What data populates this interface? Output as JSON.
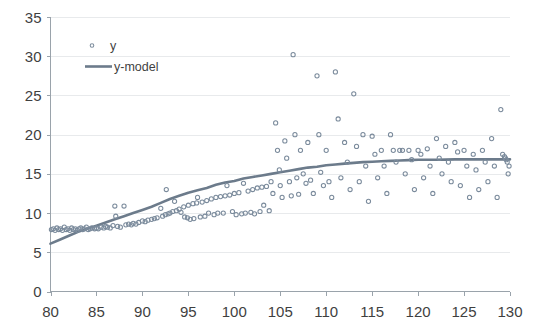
{
  "chart_data": {
    "type": "scatter",
    "title": "",
    "xlabel": "",
    "ylabel": "",
    "xlim": [
      80,
      130
    ],
    "ylim": [
      0,
      35
    ],
    "xticks": [
      80,
      85,
      90,
      95,
      100,
      105,
      110,
      115,
      120,
      125,
      130
    ],
    "yticks": [
      0,
      5,
      10,
      15,
      20,
      25,
      30,
      35
    ],
    "grid": true,
    "legend_position": "top-left",
    "colors": {
      "marker": "#7b8b9c",
      "line": "#6c7b8b",
      "gridline": "#e8eaec",
      "axis": "#9aa3ab",
      "text": "#3f3f3f",
      "background": "#ffffff"
    },
    "series": [
      {
        "name": "y",
        "type": "scatter",
        "marker": "open-circle",
        "points": [
          [
            80.1,
            7.9
          ],
          [
            80.3,
            8.0
          ],
          [
            80.5,
            7.8
          ],
          [
            80.7,
            8.1
          ],
          [
            80.9,
            7.9
          ],
          [
            81.1,
            8.0
          ],
          [
            81.3,
            7.8
          ],
          [
            81.5,
            8.2
          ],
          [
            81.7,
            7.9
          ],
          [
            81.9,
            8.0
          ],
          [
            82.1,
            7.8
          ],
          [
            82.3,
            8.1
          ],
          [
            82.5,
            7.9
          ],
          [
            82.7,
            8.0
          ],
          [
            82.9,
            7.8
          ],
          [
            83.1,
            8.0
          ],
          [
            83.3,
            8.1
          ],
          [
            83.5,
            7.9
          ],
          [
            83.7,
            8.0
          ],
          [
            83.9,
            8.2
          ],
          [
            84.1,
            7.9
          ],
          [
            84.3,
            8.0
          ],
          [
            84.5,
            8.1
          ],
          [
            84.8,
            8.0
          ],
          [
            85.0,
            8.1
          ],
          [
            85.2,
            8.0
          ],
          [
            85.5,
            8.2
          ],
          [
            85.8,
            8.1
          ],
          [
            86.0,
            8.3
          ],
          [
            86.2,
            8.2
          ],
          [
            86.5,
            8.1
          ],
          [
            86.8,
            8.4
          ],
          [
            87.0,
            10.9
          ],
          [
            87.1,
            9.6
          ],
          [
            87.3,
            8.3
          ],
          [
            87.6,
            8.2
          ],
          [
            88.0,
            10.9
          ],
          [
            88.2,
            8.5
          ],
          [
            88.5,
            8.6
          ],
          [
            88.8,
            8.5
          ],
          [
            89.0,
            8.7
          ],
          [
            89.3,
            8.6
          ],
          [
            89.6,
            8.8
          ],
          [
            90.0,
            9.0
          ],
          [
            90.3,
            8.9
          ],
          [
            90.6,
            9.1
          ],
          [
            91.0,
            9.2
          ],
          [
            91.3,
            9.3
          ],
          [
            91.6,
            9.4
          ],
          [
            92.0,
            10.6
          ],
          [
            92.2,
            9.6
          ],
          [
            92.5,
            9.8
          ],
          [
            92.6,
            13.0
          ],
          [
            92.8,
            9.9
          ],
          [
            93.0,
            10.0
          ],
          [
            93.3,
            10.2
          ],
          [
            93.5,
            11.5
          ],
          [
            93.7,
            10.3
          ],
          [
            94.0,
            10.5
          ],
          [
            94.2,
            10.1
          ],
          [
            94.5,
            10.8
          ],
          [
            94.6,
            9.5
          ],
          [
            94.9,
            9.4
          ],
          [
            95.0,
            11.0
          ],
          [
            95.2,
            9.2
          ],
          [
            95.5,
            11.2
          ],
          [
            95.6,
            9.3
          ],
          [
            95.9,
            11.3
          ],
          [
            96.0,
            12.0
          ],
          [
            96.3,
            9.5
          ],
          [
            96.5,
            11.4
          ],
          [
            96.8,
            9.6
          ],
          [
            97.0,
            11.6
          ],
          [
            97.2,
            10.0
          ],
          [
            97.5,
            11.8
          ],
          [
            97.8,
            9.8
          ],
          [
            98.0,
            12.0
          ],
          [
            98.2,
            10.0
          ],
          [
            98.5,
            12.1
          ],
          [
            98.8,
            10.0
          ],
          [
            99.0,
            12.2
          ],
          [
            99.2,
            13.5
          ],
          [
            99.5,
            12.3
          ],
          [
            99.8,
            10.2
          ],
          [
            100.0,
            12.5
          ],
          [
            100.2,
            9.8
          ],
          [
            100.5,
            12.6
          ],
          [
            100.8,
            9.9
          ],
          [
            101.0,
            13.8
          ],
          [
            101.2,
            10.0
          ],
          [
            101.5,
            12.8
          ],
          [
            101.8,
            10.1
          ],
          [
            102.0,
            13.0
          ],
          [
            102.2,
            9.9
          ],
          [
            102.5,
            13.2
          ],
          [
            102.8,
            10.2
          ],
          [
            103.0,
            13.3
          ],
          [
            103.2,
            11.0
          ],
          [
            103.5,
            13.4
          ],
          [
            103.8,
            10.3
          ],
          [
            104.0,
            14.0
          ],
          [
            104.2,
            12.5
          ],
          [
            104.5,
            21.5
          ],
          [
            104.7,
            18.0
          ],
          [
            104.9,
            15.5
          ],
          [
            105.0,
            13.5
          ],
          [
            105.2,
            12.0
          ],
          [
            105.5,
            19.2
          ],
          [
            105.7,
            17.0
          ],
          [
            106.0,
            14.0
          ],
          [
            106.2,
            12.2
          ],
          [
            106.4,
            30.2
          ],
          [
            106.6,
            20.0
          ],
          [
            106.8,
            14.5
          ],
          [
            107.0,
            12.4
          ],
          [
            107.2,
            18.0
          ],
          [
            107.5,
            15.0
          ],
          [
            107.8,
            13.8
          ],
          [
            108.0,
            19.0
          ],
          [
            108.3,
            14.2
          ],
          [
            108.6,
            12.5
          ],
          [
            109.0,
            27.5
          ],
          [
            109.2,
            20.0
          ],
          [
            109.4,
            15.2
          ],
          [
            109.7,
            13.5
          ],
          [
            110.0,
            18.0
          ],
          [
            110.3,
            14.0
          ],
          [
            110.6,
            12.0
          ],
          [
            111.0,
            28.0
          ],
          [
            111.3,
            22.0
          ],
          [
            111.6,
            14.5
          ],
          [
            112.0,
            19.0
          ],
          [
            112.3,
            16.5
          ],
          [
            112.6,
            13.0
          ],
          [
            113.0,
            25.2
          ],
          [
            113.3,
            18.5
          ],
          [
            113.6,
            14.0
          ],
          [
            114.0,
            20.0
          ],
          [
            114.3,
            16.0
          ],
          [
            114.6,
            11.5
          ],
          [
            115.0,
            19.8
          ],
          [
            115.3,
            17.5
          ],
          [
            115.6,
            14.5
          ],
          [
            116.0,
            18.0
          ],
          [
            116.3,
            16.0
          ],
          [
            116.6,
            12.5
          ],
          [
            117.0,
            20.0
          ],
          [
            117.3,
            18.0
          ],
          [
            117.6,
            16.5
          ],
          [
            118.0,
            18.0
          ],
          [
            118.3,
            18.0
          ],
          [
            118.6,
            15.0
          ],
          [
            119.0,
            18.0
          ],
          [
            119.3,
            16.8
          ],
          [
            119.6,
            13.0
          ],
          [
            120.0,
            18.0
          ],
          [
            120.3,
            17.5
          ],
          [
            120.6,
            14.5
          ],
          [
            121.0,
            18.2
          ],
          [
            121.3,
            16.0
          ],
          [
            121.6,
            12.5
          ],
          [
            122.0,
            19.5
          ],
          [
            122.3,
            17.0
          ],
          [
            122.6,
            15.0
          ],
          [
            123.0,
            18.5
          ],
          [
            123.3,
            16.5
          ],
          [
            123.6,
            14.0
          ],
          [
            124.0,
            19.0
          ],
          [
            124.3,
            17.8
          ],
          [
            124.6,
            13.5
          ],
          [
            125.0,
            18.0
          ],
          [
            125.3,
            16.0
          ],
          [
            125.6,
            12.0
          ],
          [
            126.0,
            17.5
          ],
          [
            126.3,
            15.5
          ],
          [
            126.6,
            13.0
          ],
          [
            127.0,
            18.0
          ],
          [
            127.3,
            16.5
          ],
          [
            127.6,
            14.0
          ],
          [
            128.0,
            19.5
          ],
          [
            128.3,
            16.0
          ],
          [
            128.6,
            12.0
          ],
          [
            129.0,
            23.2
          ],
          [
            129.2,
            17.5
          ],
          [
            129.4,
            17.2
          ],
          [
            129.5,
            17.0
          ],
          [
            129.6,
            16.8
          ],
          [
            129.7,
            16.5
          ],
          [
            129.8,
            15.0
          ],
          [
            129.9,
            16.0
          ]
        ]
      },
      {
        "name": "y-model",
        "type": "line",
        "points": [
          [
            80.0,
            6.1
          ],
          [
            81.0,
            6.6
          ],
          [
            82.0,
            7.1
          ],
          [
            83.0,
            7.6
          ],
          [
            84.0,
            8.0
          ],
          [
            85.0,
            8.4
          ],
          [
            86.0,
            8.8
          ],
          [
            87.0,
            9.2
          ],
          [
            88.0,
            9.6
          ],
          [
            89.0,
            10.0
          ],
          [
            90.0,
            10.4
          ],
          [
            91.0,
            10.8
          ],
          [
            92.0,
            11.3
          ],
          [
            93.0,
            11.8
          ],
          [
            94.0,
            12.2
          ],
          [
            95.0,
            12.6
          ],
          [
            96.0,
            12.9
          ],
          [
            97.0,
            13.2
          ],
          [
            98.0,
            13.6
          ],
          [
            99.0,
            13.9
          ],
          [
            100.0,
            14.1
          ],
          [
            101.0,
            14.4
          ],
          [
            102.0,
            14.6
          ],
          [
            103.0,
            14.8
          ],
          [
            104.0,
            15.0
          ],
          [
            105.0,
            15.2
          ],
          [
            106.0,
            15.4
          ],
          [
            107.0,
            15.6
          ],
          [
            108.0,
            15.8
          ],
          [
            109.0,
            15.9
          ],
          [
            110.0,
            16.1
          ],
          [
            111.0,
            16.2
          ],
          [
            112.0,
            16.3
          ],
          [
            113.0,
            16.4
          ],
          [
            114.0,
            16.5
          ],
          [
            115.0,
            16.55
          ],
          [
            116.0,
            16.6
          ],
          [
            117.0,
            16.65
          ],
          [
            118.0,
            16.7
          ],
          [
            119.0,
            16.75
          ],
          [
            120.0,
            16.8
          ],
          [
            121.0,
            16.8
          ],
          [
            122.0,
            16.8
          ],
          [
            123.0,
            16.82
          ],
          [
            124.0,
            16.85
          ],
          [
            125.0,
            16.85
          ],
          [
            126.0,
            16.85
          ],
          [
            127.0,
            16.85
          ],
          [
            128.0,
            16.85
          ],
          [
            129.0,
            16.85
          ],
          [
            130.0,
            16.85
          ]
        ]
      }
    ],
    "legend": [
      {
        "label": "y",
        "kind": "marker"
      },
      {
        "label": "y-model",
        "kind": "line"
      }
    ]
  }
}
